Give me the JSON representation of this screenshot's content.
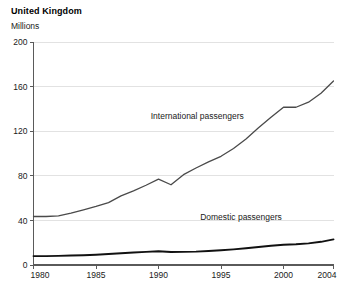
{
  "chart_data": {
    "type": "line",
    "title": "United Kingdom",
    "subtitle": "",
    "ylabel": "Millions",
    "xlabel": "",
    "ylim": [
      0,
      200
    ],
    "xlim": [
      1980,
      2004
    ],
    "yticks": [
      0,
      40,
      80,
      120,
      160,
      200
    ],
    "ytick_labels": [
      "0",
      "40",
      "80",
      "120",
      "160",
      "200"
    ],
    "xticks": [
      1980,
      1985,
      1990,
      1995,
      2000,
      2004
    ],
    "xtick_labels": [
      "1980",
      "1985",
      "1990",
      "1995",
      "2000",
      "2004"
    ],
    "grid": "horizontal",
    "legend_position": "inline-annotation",
    "x": [
      1980,
      1981,
      1982,
      1983,
      1984,
      1985,
      1986,
      1987,
      1988,
      1989,
      1990,
      1991,
      1992,
      1993,
      1994,
      1995,
      1996,
      1997,
      1998,
      1999,
      2000,
      2001,
      2002,
      2003,
      2004
    ],
    "series": [
      {
        "name": "International passengers",
        "color": "#4a4a4a",
        "values": [
          43.5,
          43.5,
          44.0,
          46.5,
          49.5,
          52.5,
          56.0,
          62.0,
          66.5,
          71.5,
          77.0,
          72.0,
          81.0,
          87.0,
          92.5,
          97.5,
          104.5,
          113.0,
          123.0,
          132.5,
          141.5,
          141.5,
          146.0,
          154.0,
          165.0
        ]
      },
      {
        "name": "Domestic passengers",
        "color": "#111111",
        "values": [
          8.0,
          8.0,
          8.2,
          8.5,
          8.8,
          9.2,
          9.8,
          10.5,
          11.2,
          11.8,
          12.3,
          11.7,
          11.8,
          12.0,
          12.5,
          13.2,
          14.0,
          15.0,
          16.2,
          17.2,
          18.2,
          18.6,
          19.4,
          20.8,
          23.0
        ]
      }
    ],
    "annotations": [
      {
        "text": "International passengers",
        "x": 1993.1,
        "y": 131.0
      },
      {
        "text": "Domestic passengers",
        "x": 1996.6,
        "y": 40.0
      }
    ]
  }
}
